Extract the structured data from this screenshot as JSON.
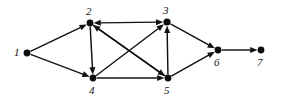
{
  "figure": {
    "kind": "directed-graph-diagram",
    "background_color": "#ffffff",
    "ink_color": "#121212",
    "width": 281,
    "height": 105
  },
  "graph": {
    "node_count": 7,
    "edge_count": 12,
    "nodes": [
      {
        "id": "1",
        "label": "1",
        "cx": 27,
        "cy": 53,
        "r": 3.4,
        "label_x": 14,
        "label_y": 47
      },
      {
        "id": "2",
        "label": "2",
        "cx": 90,
        "cy": 23,
        "r": 3.4,
        "label_x": 86,
        "label_y": 6
      },
      {
        "id": "3",
        "label": "3",
        "cx": 167,
        "cy": 22,
        "r": 3.6,
        "label_x": 163,
        "label_y": 5
      },
      {
        "id": "4",
        "label": "4",
        "cx": 93,
        "cy": 78,
        "r": 3.4,
        "label_x": 89,
        "label_y": 85
      },
      {
        "id": "5",
        "label": "5",
        "cx": 168,
        "cy": 78,
        "r": 3.4,
        "label_x": 164,
        "label_y": 85
      },
      {
        "id": "6",
        "label": "6",
        "cx": 218,
        "cy": 50,
        "r": 3.4,
        "label_x": 214,
        "label_y": 57
      },
      {
        "id": "7",
        "label": "7",
        "cx": 261,
        "cy": 50,
        "r": 3.4,
        "label_x": 257,
        "label_y": 57
      }
    ],
    "edges": [
      {
        "id": "e1-2",
        "from": "1",
        "to": "2",
        "arrow": "forward",
        "name": "edge-1-to-2"
      },
      {
        "id": "e1-4",
        "from": "1",
        "to": "4",
        "arrow": "forward",
        "name": "edge-1-to-4"
      },
      {
        "id": "e2-3",
        "from": "2",
        "to": "3",
        "arrow": "bidirectional",
        "name": "edge-2-to-3-bidirectional"
      },
      {
        "id": "e2-4",
        "from": "2",
        "to": "4",
        "arrow": "forward",
        "name": "edge-2-to-4"
      },
      {
        "id": "e2-5",
        "from": "2",
        "to": "5",
        "arrow": "forward",
        "name": "edge-2-to-5"
      },
      {
        "id": "e4-3",
        "from": "4",
        "to": "3",
        "arrow": "forward",
        "name": "edge-4-to-3"
      },
      {
        "id": "e4-5",
        "from": "4",
        "to": "5",
        "arrow": "forward",
        "name": "edge-4-to-5"
      },
      {
        "id": "e5-2",
        "from": "5",
        "to": "2",
        "arrow": "forward",
        "name": "edge-5-to-2"
      },
      {
        "id": "e5-3",
        "from": "5",
        "to": "3",
        "arrow": "forward",
        "name": "edge-5-to-3"
      },
      {
        "id": "e3-6",
        "from": "3",
        "to": "6",
        "arrow": "forward",
        "name": "edge-3-to-6"
      },
      {
        "id": "e5-6",
        "from": "5",
        "to": "6",
        "arrow": "forward",
        "name": "edge-5-to-6"
      },
      {
        "id": "e6-7",
        "from": "6",
        "to": "7",
        "arrow": "forward",
        "name": "edge-6-to-7"
      }
    ]
  }
}
